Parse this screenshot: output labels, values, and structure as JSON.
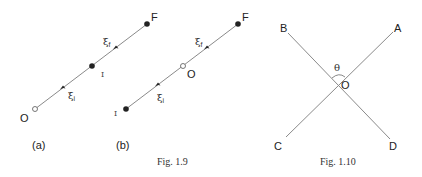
{
  "fig_1_9": {
    "caption": "Fig. 1.9",
    "panel_a": {
      "label": "(a)",
      "point_O": "O",
      "point_I": "I",
      "point_F": "F",
      "xi_symbol": "ξ",
      "xi_i_sub": "i",
      "xi_f_sub": "f"
    },
    "panel_b": {
      "label": "(b)",
      "point_O": "O",
      "point_I": "I",
      "point_F": "F",
      "xi_symbol": "ξ",
      "xi_i_sub": "i",
      "xi_f_sub": "f"
    }
  },
  "fig_1_10": {
    "caption": "Fig. 1.10",
    "point_A": "A",
    "point_B": "B",
    "point_C": "C",
    "point_D": "D",
    "point_O": "O",
    "angle": "θ"
  },
  "colors": {
    "line": "#8a8a8a",
    "point": "#222222",
    "text": "#222222"
  }
}
